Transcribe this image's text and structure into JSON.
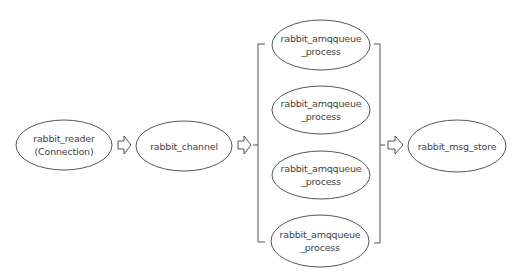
{
  "diagram": {
    "stroke_color": "#555555",
    "text_color": "#444444",
    "background": "#ffffff",
    "nodes": {
      "reader": {
        "line1": "rabbit_reader",
        "line2": "(Connection)"
      },
      "channel": {
        "line1": "rabbit_channel"
      },
      "queue1": {
        "line1": "rabbit_amqqueue",
        "line2": "_process"
      },
      "queue2": {
        "line1": "rabbit_amqqueue",
        "line2": "_process"
      },
      "queue3": {
        "line1": "rabbit_amqqueue",
        "line2": "_process"
      },
      "queue4": {
        "line1": "rabbit_amqqueue",
        "line2": "_process"
      },
      "msg_store": {
        "line1": "rabbit_msg_store"
      }
    },
    "edges": [
      {
        "from": "reader",
        "to": "channel",
        "icon": "hollow-right-arrow"
      },
      {
        "from": "channel",
        "to": "queue-group",
        "icon": "hollow-right-arrow"
      },
      {
        "from": "queue-group",
        "to": "msg_store",
        "icon": "hollow-right-arrow"
      }
    ]
  }
}
